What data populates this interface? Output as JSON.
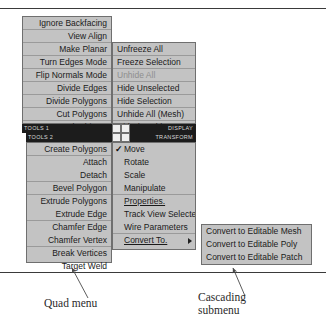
{
  "figure": {
    "captions": {
      "quad_menu": "Quad menu",
      "cascading_submenu": "Cascading\nsubmenu"
    }
  },
  "colors": {
    "menu_face": "#c3c3c3",
    "menu_border": "#6f6f6f",
    "separator": "#9a9a9a",
    "titlebar_bg": "#1c1c1c",
    "titlebar_text": "#d8d8d8",
    "text": "#1a1a1a",
    "text_disabled": "#8e8e8e",
    "page_bg": "#ffffff",
    "rule": "#3a3a3a"
  },
  "quad_menu": {
    "upper_left": {
      "title": "TOOLS 1",
      "items": [
        {
          "label": "Ignore Backfacing",
          "disabled": false,
          "separator_after": true
        },
        {
          "label": "View Align",
          "disabled": false,
          "separator_after": false
        },
        {
          "label": "Make Planar",
          "disabled": false,
          "separator_after": true
        },
        {
          "label": "Turn Edges Mode",
          "disabled": false,
          "separator_after": true
        },
        {
          "label": "Flip Normals Mode",
          "disabled": false,
          "separator_after": true
        },
        {
          "label": "Divide Edges",
          "disabled": false,
          "separator_after": false
        },
        {
          "label": "Divide Polygons",
          "disabled": false,
          "separator_after": true
        },
        {
          "label": "Cut Polygons",
          "disabled": false,
          "separator_after": true
        },
        {
          "label": "Sub-objects",
          "disabled": false,
          "separator_after": false,
          "icon": "triangle-left-icon"
        }
      ]
    },
    "upper_right": {
      "title": "DISPLAY",
      "items": [
        {
          "label": "Unfreeze All",
          "disabled": false,
          "separator_after": false
        },
        {
          "label": "Freeze Selection",
          "disabled": false,
          "separator_after": true
        },
        {
          "label": "Unhide All",
          "disabled": true,
          "separator_after": false
        },
        {
          "label": "Hide Unselected",
          "disabled": false,
          "separator_after": false
        },
        {
          "label": "Hide Selection",
          "disabled": false,
          "separator_after": true
        },
        {
          "label": "Unhide All (Mesh)",
          "disabled": false,
          "separator_after": false
        },
        {
          "label": "Hide (Mesh)",
          "disabled": false,
          "separator_after": false
        }
      ]
    },
    "lower_left": {
      "title": "TOOLS 2",
      "items": [
        {
          "label": "Create Polygons",
          "disabled": false,
          "separator_after": false
        },
        {
          "label": "Attach",
          "disabled": false,
          "separator_after": false
        },
        {
          "label": "Detach",
          "disabled": false,
          "separator_after": true
        },
        {
          "label": "Bevel Polygon",
          "disabled": false,
          "separator_after": true
        },
        {
          "label": "Extrude Polygons",
          "disabled": false,
          "separator_after": false
        },
        {
          "label": "Extrude Edge",
          "disabled": false,
          "separator_after": true
        },
        {
          "label": "Chamfer Edge",
          "disabled": false,
          "separator_after": false
        },
        {
          "label": "Chamfer Vertex",
          "disabled": false,
          "separator_after": true
        },
        {
          "label": "Break Vertices",
          "disabled": false,
          "separator_after": false
        },
        {
          "label": "Target Weld",
          "disabled": false,
          "separator_after": false
        }
      ]
    },
    "lower_right": {
      "title": "TRANSFORM",
      "items": [
        {
          "label": "Move",
          "disabled": false,
          "checked": true,
          "separator_after": false
        },
        {
          "label": "Rotate",
          "disabled": false,
          "checked": false,
          "separator_after": false
        },
        {
          "label": "Scale",
          "disabled": false,
          "checked": false,
          "separator_after": false
        },
        {
          "label": "Manipulate",
          "disabled": false,
          "checked": false,
          "separator_after": true
        },
        {
          "label": "Properties.",
          "disabled": false,
          "checked": false,
          "separator_after": false
        },
        {
          "label": "Track View Selected",
          "disabled": false,
          "checked": false,
          "separator_after": false
        },
        {
          "label": "Wire Parameters",
          "disabled": false,
          "checked": false,
          "separator_after": true
        },
        {
          "label": "Convert To.",
          "disabled": false,
          "checked": false,
          "separator_after": false,
          "icon": "triangle-right-icon"
        }
      ]
    }
  },
  "submenu": {
    "items": [
      {
        "label": "Convert to Editable Mesh"
      },
      {
        "label": "Convert to Editable Poly"
      },
      {
        "label": "Convert to Editable Patch"
      }
    ]
  }
}
